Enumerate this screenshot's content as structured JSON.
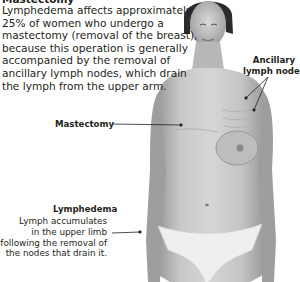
{
  "figure": {
    "title": "Mastectomy",
    "intro_lines": [
      "Lymphedema affects approximately",
      "25% of women who undergo a",
      "mastectomy (removal of the breast),",
      "because this operation is generally",
      "accompanied by the removal of",
      "ancillary lymph nodes, which drain",
      "the lymph from the upper arm."
    ],
    "labels": {
      "ancillary": [
        "Ancillary",
        "lymph nodes"
      ],
      "mastectomy": "Mastectomy",
      "lymphedema_title": "Lymphedema",
      "lymphedema_lines": [
        "Lymph accumulates",
        "in the upper limb",
        "following the removal of",
        "the nodes that drain it."
      ]
    },
    "image_subject": "photograph of a woman's torso after left-side mastectomy",
    "colors": {
      "text": "#231f20",
      "leader_line": "#231f20",
      "background": "#ffffff"
    }
  }
}
